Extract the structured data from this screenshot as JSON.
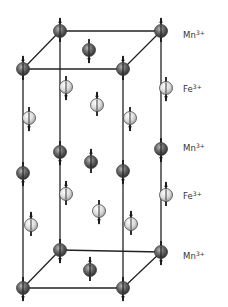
{
  "diagram": {
    "type": "crystal-structure",
    "layer_labels": [
      {
        "ion": "Mn",
        "charge": "3+",
        "y": 35
      },
      {
        "ion": "Fe",
        "charge": "3+",
        "y": 89
      },
      {
        "ion": "Mn",
        "charge": "3+",
        "y": 148
      },
      {
        "ion": "Fe",
        "charge": "3+",
        "y": 196
      },
      {
        "ion": "Mn",
        "charge": "3+",
        "y": 256
      }
    ],
    "colors": {
      "mn_fill": "#5a5a5a",
      "fe_fill": "#d6d6d6",
      "edge": "#222222"
    },
    "cell_edges": [
      [
        60,
        31,
        161,
        31
      ],
      [
        23,
        69,
        123,
        69
      ],
      [
        60,
        31,
        23,
        69
      ],
      [
        161,
        31,
        123,
        69
      ],
      [
        60,
        250,
        161,
        252
      ],
      [
        23,
        288,
        123,
        288
      ],
      [
        60,
        250,
        23,
        288
      ],
      [
        161,
        252,
        123,
        288
      ],
      [
        60,
        31,
        60,
        250
      ],
      [
        161,
        31,
        161,
        252
      ],
      [
        23,
        69,
        23,
        288
      ],
      [
        123,
        69,
        123,
        288
      ]
    ],
    "atoms": [
      {
        "ion": "Mn",
        "x": 60,
        "y": 31,
        "spin": "up"
      },
      {
        "ion": "Mn",
        "x": 161,
        "y": 31,
        "spin": "up"
      },
      {
        "ion": "Mn",
        "x": 23,
        "y": 69,
        "spin": "up"
      },
      {
        "ion": "Mn",
        "x": 123,
        "y": 69,
        "spin": "up"
      },
      {
        "ion": "Mn",
        "x": 89,
        "y": 50,
        "spin": "down"
      },
      {
        "ion": "Fe",
        "x": 66,
        "y": 87,
        "spin": "down"
      },
      {
        "ion": "Fe",
        "x": 166,
        "y": 88,
        "spin": "down"
      },
      {
        "ion": "Fe",
        "x": 29,
        "y": 118,
        "spin": "down"
      },
      {
        "ion": "Fe",
        "x": 130,
        "y": 118,
        "spin": "down"
      },
      {
        "ion": "Fe",
        "x": 97,
        "y": 105,
        "spin": "up"
      },
      {
        "ion": "Mn",
        "x": 60,
        "y": 152,
        "spin": "down"
      },
      {
        "ion": "Mn",
        "x": 161,
        "y": 149,
        "spin": "down"
      },
      {
        "ion": "Mn",
        "x": 23,
        "y": 173,
        "spin": "down"
      },
      {
        "ion": "Mn",
        "x": 123,
        "y": 171,
        "spin": "down"
      },
      {
        "ion": "Mn",
        "x": 91,
        "y": 162,
        "spin": "up"
      },
      {
        "ion": "Fe",
        "x": 66,
        "y": 194,
        "spin": "up"
      },
      {
        "ion": "Fe",
        "x": 166,
        "y": 195,
        "spin": "up"
      },
      {
        "ion": "Fe",
        "x": 31,
        "y": 225,
        "spin": "up"
      },
      {
        "ion": "Fe",
        "x": 131,
        "y": 224,
        "spin": "up"
      },
      {
        "ion": "Fe",
        "x": 99,
        "y": 211,
        "spin": "down"
      },
      {
        "ion": "Mn",
        "x": 60,
        "y": 250,
        "spin": "down"
      },
      {
        "ion": "Mn",
        "x": 161,
        "y": 252,
        "spin": "down"
      },
      {
        "ion": "Mn",
        "x": 23,
        "y": 288,
        "spin": "down"
      },
      {
        "ion": "Mn",
        "x": 123,
        "y": 288,
        "spin": "down"
      },
      {
        "ion": "Mn",
        "x": 90,
        "y": 270,
        "spin": "up"
      }
    ]
  }
}
